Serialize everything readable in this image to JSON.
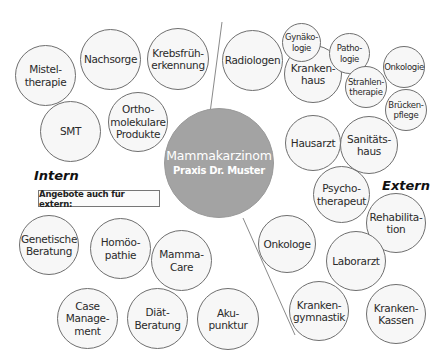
{
  "center": {
    "title": "Mammakarzinom",
    "subtitle": "Praxis Dr. Muster",
    "color": "#a3a3a3"
  },
  "sections": {
    "intern": "Intern",
    "extern": "Extern"
  },
  "box": {
    "label": "Angebote auch für extern:"
  },
  "intern_nodes": [
    {
      "label": "Mistel-\ntherapie"
    },
    {
      "label": "Nachsorge"
    },
    {
      "label": "Krebsfrüh-\nerkennung"
    },
    {
      "label": "SMT"
    },
    {
      "label": "Ortho-\nmolekulare\nProdukte"
    }
  ],
  "intern_extern_nodes": [
    {
      "label": "Genetische\nBeratung"
    },
    {
      "label": "Homöo-\npathie"
    },
    {
      "label": "Mamma-\nCare"
    },
    {
      "label": "Case\nManage-\nment"
    },
    {
      "label": "Diät-\nBeratung"
    },
    {
      "label": "Aku-\npunktur"
    }
  ],
  "extern_nodes": [
    {
      "label": "Radiologen"
    },
    {
      "label": "Kranken-\nhaus"
    },
    {
      "label": "Gynäko-\nlogie"
    },
    {
      "label": "Patho-\nlogie"
    },
    {
      "label": "Onkologie"
    },
    {
      "label": "Strahlen-\ntherapie"
    },
    {
      "label": "Brücken-\npflege"
    },
    {
      "label": "Hausarzt"
    },
    {
      "label": "Sanitäts-\nhaus"
    },
    {
      "label": "Psycho-\ntherapeut"
    },
    {
      "label": "Rehabilita-\ntion"
    },
    {
      "label": "Onkologe"
    },
    {
      "label": "Laborarzt"
    },
    {
      "label": "Kranken-\ngymnastik"
    },
    {
      "label": "Kranken-\nKassen"
    }
  ]
}
